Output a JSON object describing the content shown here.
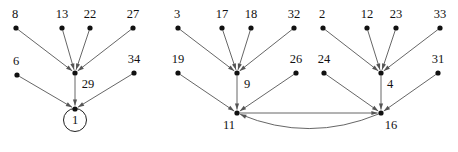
{
  "figure": {
    "title": "",
    "background_color": "#ffffff",
    "node_color": "#111111",
    "edge_color": "#555555",
    "label_color": "#111111",
    "components": [
      {
        "name": "left-component",
        "root": "1"
      },
      {
        "name": "right-component",
        "roots": [
          "11",
          "16"
        ]
      }
    ]
  },
  "chart_data": {
    "type": "diagram",
    "diagram_type": "directed-graph",
    "title": "",
    "xlabel": "",
    "ylabel": "",
    "grid": false,
    "legend": null,
    "nodes": [
      {
        "id": "8",
        "label": "8",
        "x": 16,
        "y": 28,
        "label_dx": -1,
        "label_dy": -13,
        "anchor": "middle",
        "ring": false
      },
      {
        "id": "13",
        "label": "13",
        "x": 62,
        "y": 28,
        "label_dx": 0,
        "label_dy": -13,
        "anchor": "middle",
        "ring": false
      },
      {
        "id": "22",
        "label": "22",
        "x": 90,
        "y": 28,
        "label_dx": 0,
        "label_dy": -13,
        "anchor": "middle",
        "ring": false
      },
      {
        "id": "27",
        "label": "27",
        "x": 133,
        "y": 28,
        "label_dx": 0,
        "label_dy": -13,
        "anchor": "middle",
        "ring": false
      },
      {
        "id": "6",
        "label": "6",
        "x": 17,
        "y": 75,
        "label_dx": -1,
        "label_dy": -13,
        "anchor": "middle",
        "ring": false
      },
      {
        "id": "29",
        "label": "29",
        "x": 75,
        "y": 73,
        "label_dx": 13,
        "label_dy": 12,
        "anchor": "middle",
        "ring": false
      },
      {
        "id": "34",
        "label": "34",
        "x": 134,
        "y": 73,
        "label_dx": 0,
        "label_dy": -13,
        "anchor": "middle",
        "ring": false
      },
      {
        "id": "1",
        "label": "1",
        "x": 75,
        "y": 109,
        "label_dx": 0,
        "label_dy": 12,
        "anchor": "middle",
        "ring": true,
        "ring_cx": 75,
        "ring_cy": 120,
        "ring_r": 11.5
      },
      {
        "id": "3",
        "label": "3",
        "x": 178,
        "y": 28,
        "label_dx": -1,
        "label_dy": -13,
        "anchor": "middle",
        "ring": false
      },
      {
        "id": "17",
        "label": "17",
        "x": 222,
        "y": 28,
        "label_dx": 0,
        "label_dy": -13,
        "anchor": "middle",
        "ring": false
      },
      {
        "id": "18",
        "label": "18",
        "x": 251,
        "y": 28,
        "label_dx": 0,
        "label_dy": -13,
        "anchor": "middle",
        "ring": false
      },
      {
        "id": "32",
        "label": "32",
        "x": 294,
        "y": 28,
        "label_dx": 0,
        "label_dy": -13,
        "anchor": "middle",
        "ring": false
      },
      {
        "id": "2",
        "label": "2",
        "x": 323,
        "y": 28,
        "label_dx": -1,
        "label_dy": -13,
        "anchor": "middle",
        "ring": false
      },
      {
        "id": "12",
        "label": "12",
        "x": 367,
        "y": 28,
        "label_dx": 0,
        "label_dy": -13,
        "anchor": "middle",
        "ring": false
      },
      {
        "id": "23",
        "label": "23",
        "x": 396,
        "y": 28,
        "label_dx": 0,
        "label_dy": -13,
        "anchor": "middle",
        "ring": false
      },
      {
        "id": "33",
        "label": "33",
        "x": 440,
        "y": 28,
        "label_dx": 0,
        "label_dy": -13,
        "anchor": "middle",
        "ring": false
      },
      {
        "id": "19",
        "label": "19",
        "x": 178,
        "y": 73,
        "label_dx": 0,
        "label_dy": -13,
        "anchor": "middle",
        "ring": false
      },
      {
        "id": "9",
        "label": "9",
        "x": 237,
        "y": 73,
        "label_dx": 10,
        "label_dy": 12,
        "anchor": "middle",
        "ring": false
      },
      {
        "id": "26",
        "label": "26",
        "x": 296,
        "y": 73,
        "label_dx": 0,
        "label_dy": -13,
        "anchor": "middle",
        "ring": false
      },
      {
        "id": "24",
        "label": "24",
        "x": 324,
        "y": 73,
        "label_dx": 0,
        "label_dy": -13,
        "anchor": "middle",
        "ring": false
      },
      {
        "id": "4",
        "label": "4",
        "x": 381,
        "y": 73,
        "label_dx": 9,
        "label_dy": 12,
        "anchor": "middle",
        "ring": false
      },
      {
        "id": "31",
        "label": "31",
        "x": 438,
        "y": 73,
        "label_dx": 0,
        "label_dy": -13,
        "anchor": "middle",
        "ring": false
      },
      {
        "id": "11",
        "label": "11",
        "x": 237,
        "y": 113,
        "label_dx": -8,
        "label_dy": 13,
        "anchor": "middle",
        "ring": false
      },
      {
        "id": "16",
        "label": "16",
        "x": 381,
        "y": 113,
        "label_dx": 10,
        "label_dy": 13,
        "anchor": "middle",
        "ring": false
      }
    ],
    "edges": [
      {
        "from": "8",
        "to": "29",
        "curve": 0
      },
      {
        "from": "13",
        "to": "29",
        "curve": 0
      },
      {
        "from": "22",
        "to": "29",
        "curve": 0
      },
      {
        "from": "27",
        "to": "29",
        "curve": 0
      },
      {
        "from": "29",
        "to": "1",
        "curve": 0
      },
      {
        "from": "6",
        "to": "1",
        "curve": 0
      },
      {
        "from": "34",
        "to": "1",
        "curve": 0
      },
      {
        "from": "3",
        "to": "9",
        "curve": 0
      },
      {
        "from": "17",
        "to": "9",
        "curve": 0
      },
      {
        "from": "18",
        "to": "9",
        "curve": 0
      },
      {
        "from": "32",
        "to": "9",
        "curve": 0
      },
      {
        "from": "9",
        "to": "11",
        "curve": 0
      },
      {
        "from": "19",
        "to": "11",
        "curve": 0
      },
      {
        "from": "26",
        "to": "11",
        "curve": 0
      },
      {
        "from": "2",
        "to": "4",
        "curve": 0
      },
      {
        "from": "12",
        "to": "4",
        "curve": 0
      },
      {
        "from": "23",
        "to": "4",
        "curve": 0
      },
      {
        "from": "33",
        "to": "4",
        "curve": 0
      },
      {
        "from": "4",
        "to": "16",
        "curve": 0
      },
      {
        "from": "24",
        "to": "16",
        "curve": 0
      },
      {
        "from": "31",
        "to": "16",
        "curve": 0
      },
      {
        "from": "11",
        "to": "16",
        "curve": 0
      },
      {
        "from": "16",
        "to": "11",
        "curve": -30,
        "reverse_render": true
      }
    ]
  }
}
